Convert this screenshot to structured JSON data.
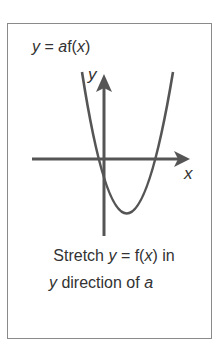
{
  "diagram": {
    "title": {
      "y": "y",
      "eq": " = ",
      "a": "a",
      "f": "f(",
      "x": "x",
      "close": ")"
    },
    "axis_labels": {
      "x": "x",
      "y": "y"
    },
    "caption": {
      "line1_pre": "Stretch ",
      "line1_y": "y",
      "line1_mid": " = f(",
      "line1_x": "x",
      "line1_post": ") in",
      "line2_y": "y",
      "line2_mid": " direction of ",
      "line2_a": "a"
    },
    "curve": {
      "type": "parabola",
      "description": "upward-opening parabola crossing x-axis on both sides of y-axis, vertex below x-axis right of y-axis"
    },
    "colors": {
      "stroke": "#555555",
      "frame": "#8a8a8a",
      "text": "#333333"
    }
  }
}
